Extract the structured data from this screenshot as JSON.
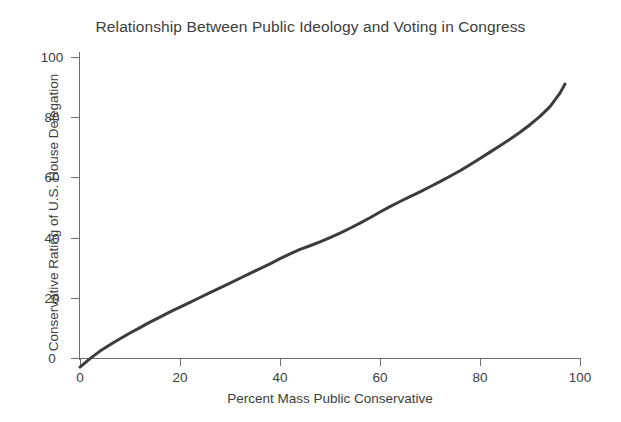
{
  "chart_data": {
    "type": "line",
    "title": "Relationship Between Public Ideology and Voting in Congress",
    "xlabel": "Percent Mass Public Conservative",
    "ylabel": "Conservative Rating of U.S. House Delegation",
    "xlim": [
      -2,
      100
    ],
    "ylim": [
      -5,
      104
    ],
    "xticks": [
      0,
      20,
      40,
      60,
      80,
      100
    ],
    "xticklabels": [
      "0",
      "20",
      "40",
      "60",
      "80",
      "100"
    ],
    "yticks": [
      0,
      20,
      40,
      60,
      80,
      100
    ],
    "yticklabels": [
      "0",
      "20",
      "40",
      "60",
      "80",
      "100"
    ],
    "grid": false,
    "legend": null,
    "line_color": "#3c3c3c",
    "line_width": 3.0,
    "series": [
      {
        "name": "Fitted relationship",
        "x": [
          0,
          2,
          4,
          6,
          8,
          10,
          12,
          14,
          16,
          18,
          20,
          22,
          24,
          26,
          28,
          30,
          32,
          34,
          36,
          38,
          40,
          42,
          44,
          46,
          48,
          50,
          52,
          54,
          56,
          58,
          60,
          62,
          64,
          66,
          68,
          70,
          72,
          74,
          76,
          78,
          80,
          82,
          84,
          86,
          88,
          90,
          92,
          94,
          96,
          97
        ],
        "y": [
          -3.0,
          -0.2,
          2.3,
          4.4,
          6.4,
          8.3,
          10.1,
          11.9,
          13.6,
          15.3,
          16.9,
          18.5,
          20.1,
          21.7,
          23.3,
          24.9,
          26.5,
          28.1,
          29.7,
          31.3,
          33.0,
          34.6,
          36.1,
          37.3,
          38.6,
          40.0,
          41.5,
          43.1,
          44.8,
          46.6,
          48.5,
          50.3,
          52.0,
          53.6,
          55.2,
          56.9,
          58.6,
          60.4,
          62.2,
          64.2,
          66.3,
          68.4,
          70.5,
          72.7,
          75.0,
          77.5,
          80.3,
          83.5,
          88.0,
          91.0
        ]
      }
    ],
    "annotations": []
  },
  "colors": {
    "background": "#ffffff",
    "text": "#3d3d3d",
    "axis": "#6d6d6d",
    "line": "#3c3c3c"
  }
}
